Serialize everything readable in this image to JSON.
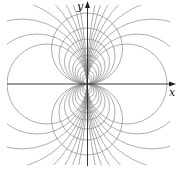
{
  "figure": {
    "axes": {
      "x_label": "x",
      "y_label": "y"
    },
    "colors": {
      "curves": "#8a8a8a",
      "axes": "#222222"
    },
    "origin_px": [
      87,
      84
    ],
    "vertical_family_radii": [
      3.5,
      5,
      7,
      9.5,
      12,
      14.5,
      18,
      22.5,
      28,
      35.5
    ],
    "horizontal_family_radii": [
      40,
      50,
      65,
      85,
      115,
      160,
      240,
      400
    ]
  }
}
